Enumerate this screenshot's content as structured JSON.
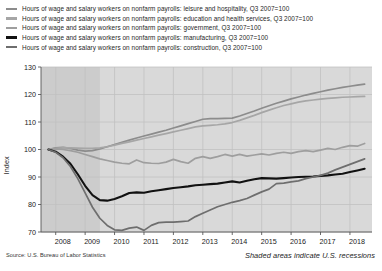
{
  "legend": {
    "items": [
      {
        "label": "Hours of wage and salary workers on nonfarm payrolls: leisure and hospitality, Q3 2007=100",
        "color": "#8c8c8c",
        "key": "leisure_and_hospitality"
      },
      {
        "label": "Hours of wage and salary workers on nonfarm payrolls: education and health services, Q3 2007=100",
        "color": "#a6a6a6",
        "key": "education_and_health_services"
      },
      {
        "label": "Hours of wage and salary workers on nonfarm payrolls: government, Q3 2007=100",
        "color": "#9e9e9e",
        "key": "government"
      },
      {
        "label": "Hours of wage and salary workers on nonfarm payrolls: manufacturing, Q3 2007=100",
        "color": "#111111",
        "key": "manufacturing"
      },
      {
        "label": "Hours of wage and salary workers on nonfarm payrolls: construction, Q3 2007=100",
        "color": "#6e6e6e",
        "key": "construction"
      }
    ]
  },
  "axes": {
    "ylabel": "Index",
    "yticks": [
      "130",
      "120",
      "110",
      "100",
      "90",
      "80",
      "70"
    ],
    "xticks": [
      "2008",
      "2009",
      "2010",
      "2011",
      "2012",
      "2013",
      "2014",
      "2015",
      "2016",
      "2017",
      "2018"
    ]
  },
  "footer": {
    "source": "Source: U.S. Bureau of Labor Statistics",
    "recession_note": "Shaded areas indicate U.S. recessions"
  },
  "chart_data": {
    "type": "line",
    "title": "",
    "xlabel": "",
    "ylabel": "Index",
    "ylim": [
      70,
      130
    ],
    "xlim": [
      2007.5,
      2018.75
    ],
    "grid": true,
    "legend_position": "above-plot",
    "plot_background": "#d9d9d9",
    "gridline_color": "#c2c2c2",
    "recession_band_color": "#cccccc",
    "recession_bands": [
      [
        2007.5,
        2009.5
      ]
    ],
    "x": [
      2007.75,
      2008.0,
      2008.25,
      2008.5,
      2008.75,
      2009.0,
      2009.25,
      2009.5,
      2009.75,
      2010.0,
      2010.25,
      2010.5,
      2010.75,
      2011.0,
      2011.25,
      2011.5,
      2011.75,
      2012.0,
      2012.25,
      2012.5,
      2012.75,
      2013.0,
      2013.25,
      2013.5,
      2013.75,
      2014.0,
      2014.25,
      2014.5,
      2014.75,
      2015.0,
      2015.25,
      2015.5,
      2015.75,
      2016.0,
      2016.25,
      2016.5,
      2016.75,
      2017.0,
      2017.25,
      2017.5,
      2017.75,
      2018.0,
      2018.25,
      2018.5
    ],
    "series": [
      {
        "name": "leisure and hospitality",
        "color": "#8c8c8c",
        "values": [
          100.0,
          100.6,
          100.8,
          100.4,
          99.8,
          99.4,
          99.6,
          100.2,
          101.0,
          101.8,
          102.6,
          103.4,
          104.2,
          104.9,
          105.6,
          106.3,
          107.0,
          107.8,
          108.6,
          109.4,
          110.2,
          111.0,
          111.2,
          111.2,
          111.3,
          111.4,
          112.2,
          113.1,
          114.0,
          115.0,
          115.9,
          116.8,
          117.6,
          118.4,
          119.1,
          119.8,
          120.4,
          121.0,
          121.6,
          122.1,
          122.6,
          123.0,
          123.4,
          123.8
        ]
      },
      {
        "name": "education and health services",
        "color": "#a6a6a6",
        "values": [
          100.0,
          100.4,
          100.6,
          100.6,
          100.5,
          100.4,
          100.4,
          100.6,
          101.0,
          101.6,
          102.2,
          102.8,
          103.4,
          104.0,
          104.6,
          105.2,
          105.8,
          106.4,
          107.0,
          107.6,
          108.2,
          108.6,
          108.8,
          109.0,
          109.3,
          109.8,
          110.6,
          111.5,
          112.4,
          113.4,
          114.3,
          115.2,
          116.0,
          116.6,
          117.2,
          117.7,
          118.0,
          118.3,
          118.6,
          118.8,
          119.0,
          119.1,
          119.2,
          119.3
        ]
      },
      {
        "name": "government",
        "color": "#9e9e9e",
        "values": [
          100.0,
          100.2,
          100.0,
          99.6,
          99.0,
          98.2,
          97.4,
          96.6,
          96.0,
          95.4,
          95.0,
          94.8,
          96.2,
          95.2,
          95.0,
          94.9,
          95.4,
          96.4,
          95.6,
          95.0,
          96.8,
          97.4,
          96.8,
          97.4,
          98.2,
          97.6,
          98.2,
          97.6,
          98.0,
          98.4,
          98.0,
          98.6,
          99.0,
          98.6,
          99.2,
          99.6,
          99.2,
          99.8,
          100.4,
          100.0,
          100.8,
          101.4,
          101.2,
          102.2
        ]
      },
      {
        "name": "manufacturing",
        "color": "#111111",
        "values": [
          100.0,
          99.2,
          97.4,
          94.8,
          91.0,
          86.8,
          83.4,
          81.6,
          81.4,
          82.0,
          83.0,
          84.2,
          84.4,
          84.3,
          84.8,
          85.2,
          85.6,
          86.0,
          86.3,
          86.6,
          87.0,
          87.2,
          87.4,
          87.6,
          88.0,
          88.4,
          88.0,
          88.6,
          89.2,
          89.6,
          89.5,
          89.4,
          89.6,
          89.8,
          90.0,
          90.1,
          90.2,
          90.4,
          90.6,
          90.9,
          91.2,
          91.8,
          92.4,
          93.0
        ]
      },
      {
        "name": "construction",
        "color": "#6e6e6e",
        "values": [
          100.0,
          99.0,
          97.0,
          93.8,
          89.4,
          84.2,
          79.0,
          75.0,
          72.4,
          70.8,
          70.6,
          71.4,
          71.8,
          70.6,
          72.4,
          73.4,
          73.6,
          73.6,
          73.8,
          74.0,
          75.6,
          76.8,
          78.0,
          79.2,
          80.0,
          80.8,
          81.4,
          82.2,
          83.4,
          84.6,
          85.6,
          87.6,
          87.8,
          88.2,
          88.6,
          89.4,
          90.0,
          90.6,
          91.4,
          92.6,
          93.6,
          94.6,
          95.6,
          96.6
        ]
      }
    ]
  }
}
